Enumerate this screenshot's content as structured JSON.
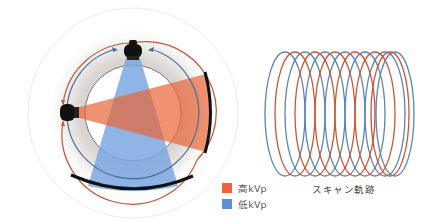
{
  "figure": {
    "left_panel": {
      "name": "gantry-dual-energy-diagram",
      "sources": [
        {
          "name": "high-kvp-tube",
          "position": "left"
        },
        {
          "name": "low-kvp-tube",
          "position": "top"
        }
      ]
    },
    "right_panel": {
      "name": "helical-scan-trajectory",
      "caption": "スキャン軌跡",
      "loops": 7
    },
    "legend": [
      {
        "label": "高kVp",
        "color": "#f0643c"
      },
      {
        "label": "低kVp",
        "color": "#5b8fd6"
      }
    ],
    "colors": {
      "high_kvp": "#e8693f",
      "low_kvp": "#6f9fdc",
      "helix_red": "#d0552f",
      "helix_blue": "#5b84b8",
      "ring_gray": "#d8d5d2",
      "detector": "#111111"
    }
  }
}
